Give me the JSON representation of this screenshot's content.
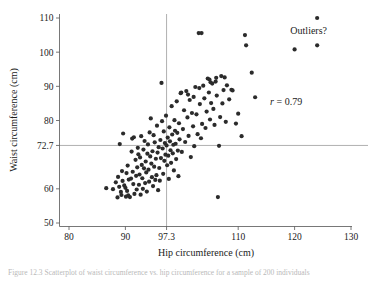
{
  "figure": {
    "caption": "Figure 12.3  Scatterplot of waist circumference vs. hip circumference for a sample of 200 individuals"
  },
  "chart_data": {
    "type": "scatter",
    "title": "",
    "xlabel": "Hip circumference (cm)",
    "ylabel": "Waist circumference (cm)",
    "xlim": [
      78,
      131
    ],
    "ylim": [
      47,
      112
    ],
    "xticks": [
      80,
      90,
      97.3,
      110,
      120,
      130
    ],
    "xtick_labels": [
      "80",
      "90",
      "97.3",
      "110",
      "120",
      "130"
    ],
    "yticks": [
      50,
      60,
      72.7,
      80,
      90,
      100,
      110
    ],
    "ytick_labels": [
      "50",
      "60",
      "72.7",
      "80",
      "90",
      "100",
      "110"
    ],
    "grid": false,
    "legend": null,
    "reference_lines": [
      {
        "name": "mean-hip-vline",
        "orientation": "vertical",
        "value": 97.3,
        "label": "97.3"
      },
      {
        "name": "mean-waist-hline",
        "orientation": "horizontal",
        "value": 72.7,
        "label": "72.7"
      }
    ],
    "annotations": [
      {
        "name": "correlation-annotation",
        "text": "r = 0.79",
        "text_italic_prefix": "r",
        "text_rest": " = 0.79",
        "x": 118.5,
        "y": 84.5
      },
      {
        "name": "outliers-annotation",
        "text": "Outliers?",
        "x": 122.5,
        "y": 105.2
      }
    ],
    "marker": {
      "shape": "circle",
      "size": 2.1,
      "color": "#2b2b2b"
    },
    "point_count": 169,
    "points": [
      [
        86.6,
        60.2
      ],
      [
        87.8,
        59.9
      ],
      [
        88.3,
        61.9
      ],
      [
        88.6,
        57.5
      ],
      [
        88.7,
        63.5
      ],
      [
        88.9,
        60.6
      ],
      [
        89.0,
        73.1
      ],
      [
        89.2,
        59.1
      ],
      [
        89.3,
        58.2
      ],
      [
        89.4,
        65.2
      ],
      [
        89.5,
        62.3
      ],
      [
        89.6,
        76.2
      ],
      [
        89.8,
        61.0
      ],
      [
        90.0,
        60.3
      ],
      [
        90.1,
        57.7
      ],
      [
        90.2,
        64.6
      ],
      [
        90.3,
        59.4
      ],
      [
        90.4,
        66.8
      ],
      [
        90.5,
        58.1
      ],
      [
        90.6,
        62.7
      ],
      [
        90.8,
        57.6
      ],
      [
        91.0,
        63.0
      ],
      [
        91.1,
        70.9
      ],
      [
        91.2,
        74.7
      ],
      [
        91.3,
        65.0
      ],
      [
        91.4,
        61.4
      ],
      [
        91.5,
        75.1
      ],
      [
        91.6,
        58.5
      ],
      [
        91.8,
        68.5
      ],
      [
        91.9,
        63.8
      ],
      [
        92.0,
        59.8
      ],
      [
        92.1,
        66.3
      ],
      [
        92.2,
        72.0
      ],
      [
        92.3,
        70.1
      ],
      [
        92.4,
        61.2
      ],
      [
        92.5,
        64.2
      ],
      [
        92.6,
        69.2
      ],
      [
        92.7,
        58.3
      ],
      [
        92.8,
        75.4
      ],
      [
        92.9,
        67.0
      ],
      [
        93.0,
        63.1
      ],
      [
        93.1,
        60.0
      ],
      [
        93.2,
        71.5
      ],
      [
        93.3,
        66.0
      ],
      [
        93.4,
        74.0
      ],
      [
        93.5,
        61.7
      ],
      [
        93.6,
        68.0
      ],
      [
        93.7,
        64.8
      ],
      [
        93.8,
        59.2
      ],
      [
        93.9,
        70.3
      ],
      [
        94.0,
        73.0
      ],
      [
        94.1,
        65.6
      ],
      [
        94.2,
        62.1
      ],
      [
        94.3,
        76.5
      ],
      [
        94.4,
        69.5
      ],
      [
        94.5,
        80.6
      ],
      [
        94.6,
        67.4
      ],
      [
        94.7,
        63.4
      ],
      [
        94.8,
        71.0
      ],
      [
        94.9,
        60.8
      ],
      [
        95.0,
        75.7
      ],
      [
        95.1,
        66.5
      ],
      [
        95.2,
        73.6
      ],
      [
        95.3,
        62.6
      ],
      [
        95.4,
        68.8
      ],
      [
        95.5,
        64.0
      ],
      [
        95.6,
        78.5
      ],
      [
        95.7,
        70.6
      ],
      [
        95.8,
        59.6
      ],
      [
        95.9,
        72.2
      ],
      [
        96.0,
        66.1
      ],
      [
        96.1,
        62.4
      ],
      [
        96.2,
        74.3
      ],
      [
        96.3,
        69.0
      ],
      [
        96.4,
        91.0
      ],
      [
        96.5,
        79.8
      ],
      [
        96.6,
        71.8
      ],
      [
        96.7,
        64.4
      ],
      [
        96.8,
        76.8
      ],
      [
        96.9,
        68.2
      ],
      [
        97.0,
        73.4
      ],
      [
        97.1,
        70.0
      ],
      [
        97.2,
        81.4
      ],
      [
        97.3,
        72.7
      ],
      [
        97.4,
        66.9
      ],
      [
        97.5,
        75.0
      ],
      [
        97.6,
        69.7
      ],
      [
        97.7,
        62.9
      ],
      [
        97.8,
        78.0
      ],
      [
        97.9,
        73.9
      ],
      [
        98.0,
        71.3
      ],
      [
        98.1,
        67.6
      ],
      [
        98.2,
        84.2
      ],
      [
        98.3,
        75.9
      ],
      [
        98.4,
        70.4
      ],
      [
        98.5,
        72.9
      ],
      [
        98.6,
        65.4
      ],
      [
        98.7,
        80.1
      ],
      [
        98.8,
        77.0
      ],
      [
        98.9,
        73.2
      ],
      [
        99.0,
        68.7
      ],
      [
        99.1,
        85.6
      ],
      [
        99.2,
        76.4
      ],
      [
        99.3,
        71.2
      ],
      [
        99.4,
        63.7
      ],
      [
        99.5,
        79.2
      ],
      [
        99.6,
        74.5
      ],
      [
        99.8,
        88.0
      ],
      [
        100.0,
        70.8
      ],
      [
        100.2,
        77.5
      ],
      [
        100.4,
        83.0
      ],
      [
        100.6,
        73.7
      ],
      [
        100.8,
        88.6
      ],
      [
        101.0,
        80.9
      ],
      [
        101.2,
        75.5
      ],
      [
        101.4,
        86.0
      ],
      [
        101.6,
        69.3
      ],
      [
        101.8,
        82.2
      ],
      [
        102.0,
        78.3
      ],
      [
        102.2,
        72.5
      ],
      [
        102.4,
        89.8
      ],
      [
        102.6,
        81.8
      ],
      [
        102.8,
        76.0
      ],
      [
        103.0,
        105.6
      ],
      [
        103.2,
        84.8
      ],
      [
        103.4,
        74.8
      ],
      [
        103.6,
        79.0
      ],
      [
        103.8,
        90.2
      ],
      [
        104.0,
        86.5
      ],
      [
        104.2,
        77.8
      ],
      [
        104.4,
        82.6
      ],
      [
        104.6,
        92.3
      ],
      [
        104.8,
        88.2
      ],
      [
        105.0,
        80.3
      ],
      [
        105.2,
        85.1
      ],
      [
        105.4,
        90.8
      ],
      [
        105.6,
        83.4
      ],
      [
        105.8,
        78.7
      ],
      [
        106.0,
        91.4
      ],
      [
        106.2,
        87.3
      ],
      [
        106.4,
        57.6
      ],
      [
        106.6,
        72.6
      ],
      [
        106.8,
        81.0
      ],
      [
        107.0,
        93.0
      ],
      [
        107.2,
        85.0
      ],
      [
        107.4,
        88.9
      ],
      [
        107.6,
        92.6
      ],
      [
        107.8,
        79.6
      ],
      [
        108.0,
        90.3
      ],
      [
        108.4,
        86.2
      ],
      [
        109.0,
        88.8
      ],
      [
        109.6,
        79.1
      ],
      [
        110.0,
        82.0
      ],
      [
        110.6,
        75.4
      ],
      [
        111.2,
        105.0
      ],
      [
        111.4,
        102.0
      ],
      [
        112.4,
        94.0
      ],
      [
        113.0,
        86.8
      ],
      [
        103.5,
        105.6
      ],
      [
        99.9,
        88.2
      ],
      [
        101.1,
        87.6
      ],
      [
        102.1,
        86.9
      ],
      [
        104.9,
        92.0
      ],
      [
        106.1,
        92.5
      ],
      [
        105.1,
        91.2
      ],
      [
        103.1,
        89.5
      ],
      [
        108.8,
        89.0
      ],
      [
        120.0,
        100.8
      ],
      [
        124.0,
        110.0
      ],
      [
        124.0,
        102.0
      ]
    ],
    "outlier_points": [
      [
        120.0,
        100.8
      ],
      [
        124.0,
        110.0
      ],
      [
        124.0,
        102.0
      ]
    ]
  }
}
